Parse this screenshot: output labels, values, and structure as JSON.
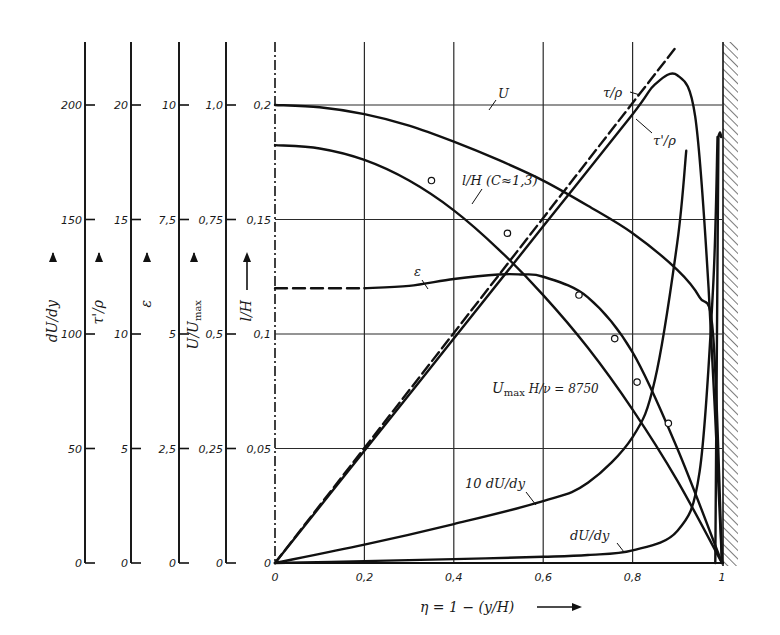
{
  "chart_data": {
    "type": "line",
    "title": "",
    "xlabel": "η = 1 − (y/H)",
    "x_ticks": [
      "0",
      "0,2",
      "0,4",
      "0,6",
      "0,8",
      "1"
    ],
    "xlim": [
      0,
      1
    ],
    "grid": true,
    "annotation": "U_max H/ν = 8750",
    "y_axes": [
      {
        "id": "dUdy",
        "label": "dU/dy",
        "ticks": [
          "0",
          "50",
          "100",
          "150",
          "200"
        ],
        "range": [
          0,
          200
        ]
      },
      {
        "id": "tau_prime",
        "label": "τ'/ρ",
        "ticks": [
          "0",
          "5",
          "10",
          "15",
          "20"
        ],
        "range": [
          0,
          20
        ]
      },
      {
        "id": "eps",
        "label": "ε",
        "ticks": [
          "0",
          "2,5",
          "5",
          "7,5",
          "10"
        ],
        "range": [
          0,
          10
        ]
      },
      {
        "id": "U_rel",
        "label": "U/U_max",
        "ticks": [
          "0",
          "0,25",
          "0,5",
          "0,75",
          "1,0"
        ],
        "range": [
          0,
          1.0
        ]
      },
      {
        "id": "lH",
        "label": "l/H",
        "ticks": [
          "0",
          "0,05",
          "0,1",
          "0,15",
          "0,2"
        ],
        "range": [
          0,
          0.2
        ]
      }
    ],
    "series": [
      {
        "name": "U",
        "axis": "U_rel",
        "style": "solid",
        "x": [
          0,
          0.1,
          0.2,
          0.3,
          0.4,
          0.5,
          0.6,
          0.7,
          0.8,
          0.9,
          0.95,
          0.98,
          1.0
        ],
        "y": [
          1.0,
          0.995,
          0.98,
          0.955,
          0.92,
          0.88,
          0.835,
          0.78,
          0.72,
          0.64,
          0.58,
          0.5,
          0.0
        ]
      },
      {
        "name": "l/H (C≈1,3)",
        "axis": "lH",
        "style": "solid",
        "x": [
          0,
          0.1,
          0.2,
          0.3,
          0.4,
          0.5,
          0.6,
          0.7,
          0.8,
          0.9,
          1.0
        ],
        "y": [
          0.1825,
          0.181,
          0.176,
          0.167,
          0.154,
          0.137,
          0.117,
          0.094,
          0.067,
          0.036,
          0.0
        ]
      },
      {
        "name": "l/H measured",
        "axis": "lH",
        "style": "markers",
        "x": [
          0.35,
          0.52,
          0.68,
          0.76,
          0.81,
          0.88
        ],
        "y": [
          0.167,
          0.144,
          0.117,
          0.098,
          0.079,
          0.061
        ]
      },
      {
        "name": "ε",
        "axis": "eps",
        "style": "solid (dashed for η<0.2)",
        "x": [
          0,
          0.2,
          0.3,
          0.4,
          0.5,
          0.55,
          0.6,
          0.7,
          0.8,
          0.9,
          1.0
        ],
        "y": [
          6.0,
          6.0,
          6.05,
          6.2,
          6.3,
          6.3,
          6.25,
          5.8,
          4.6,
          2.5,
          0.0
        ]
      },
      {
        "name": "τ/ρ",
        "axis": "tau_prime",
        "style": "dashed",
        "x": [
          0,
          0.2,
          0.4,
          0.6,
          0.8,
          0.9
        ],
        "y": [
          0,
          5.0,
          10.0,
          15.0,
          20.0,
          22.6
        ]
      },
      {
        "name": "τ'/ρ",
        "axis": "tau_prime",
        "style": "solid",
        "x": [
          0,
          0.2,
          0.4,
          0.6,
          0.8,
          0.85,
          0.9,
          0.94,
          0.97,
          1.0
        ],
        "y": [
          0,
          4.9,
          9.8,
          14.7,
          19.6,
          20.9,
          21.3,
          19.5,
          12,
          0
        ]
      },
      {
        "name": "10 dU/dy",
        "axis": "dUdy",
        "style": "solid",
        "x": [
          0,
          0.2,
          0.4,
          0.6,
          0.7,
          0.8,
          0.85,
          0.9,
          0.92
        ],
        "y": [
          0,
          8,
          17,
          27,
          35,
          55,
          80,
          140,
          180
        ]
      },
      {
        "name": "dU/dy",
        "axis": "dUdy",
        "style": "solid",
        "x": [
          0,
          0.2,
          0.4,
          0.6,
          0.7,
          0.8,
          0.9,
          0.95,
          0.98,
          0.99
        ],
        "y": [
          0,
          0.8,
          1.7,
          2.7,
          3.5,
          5.5,
          14,
          40,
          120,
          186
        ]
      }
    ]
  },
  "labels": {
    "x_title": "η = 1 − (y/H)",
    "curve_U": "U",
    "curve_lH": "l/H (C≈1,3)",
    "curve_eps": "ε",
    "curve_tau": "τ/ρ",
    "curve_tau_prime": "τ'/ρ",
    "curve_10dudy": "10 dU/dy",
    "curve_dudy": "dU/dy",
    "reynolds": "U_max H/ν = 8750",
    "reynolds_main": "U",
    "reynolds_sub": "max",
    "reynolds_rest": " H/ν = 8750",
    "axis_dudy": "dU/dy",
    "axis_tau_prime": "τ'/ρ",
    "axis_eps": "ε",
    "axis_urel": "U/U",
    "axis_urel_sub": "max",
    "axis_lh": "l/H"
  }
}
